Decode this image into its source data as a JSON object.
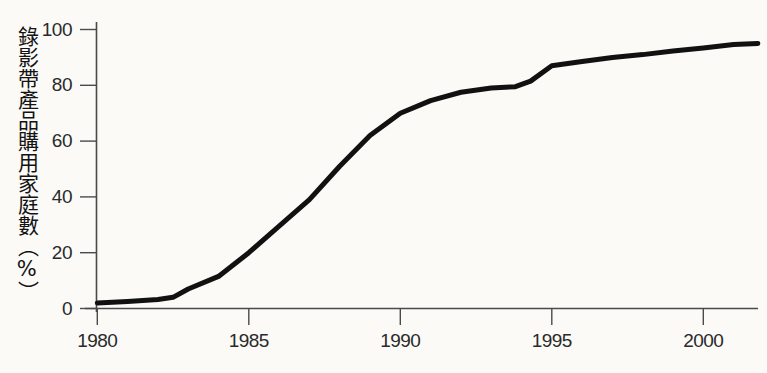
{
  "chart_data": {
    "type": "line",
    "title": "",
    "subtitle": "",
    "xlabel": "",
    "ylabel": "錄影帶產品購用家庭數（%）",
    "xlim": [
      1980,
      2001.8
    ],
    "ylim": [
      0,
      100
    ],
    "grid": false,
    "legend": null,
    "x_ticks": [
      1980,
      1985,
      1990,
      1995,
      2000
    ],
    "x_tick_labels": [
      "1980",
      "1985",
      "1990",
      "1995",
      "2000"
    ],
    "y_ticks": [
      0,
      20,
      40,
      60,
      80,
      100
    ],
    "y_tick_labels": [
      "0",
      "20",
      "40",
      "60",
      "80",
      "100"
    ],
    "line_color": "#111111",
    "line_width": 5,
    "series": [
      {
        "name": "錄影帶產品購用家庭數",
        "x": [
          1980,
          1981,
          1982,
          1982.5,
          1983,
          1984,
          1985,
          1986,
          1987,
          1988,
          1989,
          1990,
          1991,
          1992,
          1993,
          1993.8,
          1994.3,
          1995,
          1996,
          1997,
          1998,
          1999,
          2000,
          2001,
          2001.8
        ],
        "values": [
          2,
          2.5,
          3.2,
          4,
          7,
          11.5,
          20,
          29.5,
          39,
          51,
          62,
          70,
          74.5,
          77.5,
          79,
          79.5,
          81.5,
          87,
          88.5,
          90,
          91,
          92.3,
          93.4,
          94.6,
          95
        ]
      }
    ],
    "annotations": []
  },
  "axis": {
    "y_title_chars": "錄影帶產品購用家庭數（%）"
  }
}
